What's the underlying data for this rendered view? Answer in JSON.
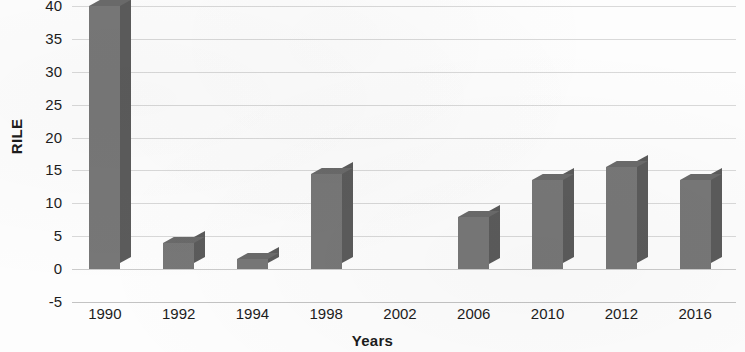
{
  "chart_data": {
    "type": "bar",
    "title": "",
    "xlabel": "Years",
    "ylabel": "RILE",
    "categories": [
      "1990",
      "1992",
      "1994",
      "1998",
      "2002",
      "2006",
      "2010",
      "2012",
      "2016"
    ],
    "values": [
      40,
      4,
      1.5,
      14.5,
      0,
      8,
      13.5,
      15.5,
      13.5
    ],
    "ylim": [
      -5,
      40
    ],
    "yticks": [
      40,
      35,
      30,
      25,
      20,
      15,
      10,
      5,
      0,
      -5
    ],
    "ytick_labels": [
      "40",
      "35",
      "30",
      "25",
      "20",
      "15",
      "10",
      "5",
      "0",
      "-5"
    ],
    "grid": true,
    "grid_axis": "y",
    "legend": false,
    "bar_style": "3d",
    "bar_color": "#777777",
    "bar_side_color": "#5b5b5b",
    "bar_top_color": "#6a6a6a",
    "gridline_color": "#d2d2d2",
    "background_color": "#fdfdfd",
    "text_color": "#1c1c1c"
  }
}
